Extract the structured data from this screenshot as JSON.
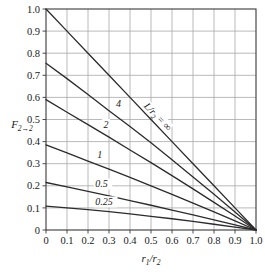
{
  "chart_data": {
    "type": "line",
    "title": "",
    "xlabel": "r1/r2",
    "xlabel_main": "r",
    "xlabel_sub1": "1",
    "xlabel_mid": "/r",
    "xlabel_sub2": "2",
    "ylabel": "F2→2",
    "ylabel_main": "F",
    "ylabel_sub": "2→2",
    "xlim": [
      0,
      1.0
    ],
    "ylim": [
      0,
      1.0
    ],
    "grid": true,
    "legend_position": "inline-curve-labels",
    "xticks": [
      "0",
      "0.1",
      "0.2",
      "0.3",
      "0.4",
      "0.5",
      "0.6",
      "0.7",
      "0.8",
      "0.9",
      "1.0"
    ],
    "xtick_values": [
      0,
      0.1,
      0.2,
      0.3,
      0.4,
      0.5,
      0.6,
      0.7,
      0.8,
      0.9,
      1.0
    ],
    "yticks": [
      "0",
      "0.1",
      "0.2",
      "0.3",
      "0.4",
      "0.5",
      "0.6",
      "0.7",
      "0.8",
      "0.9",
      "1.0"
    ],
    "ytick_values": [
      0,
      0.1,
      0.2,
      0.3,
      0.4,
      0.5,
      0.6,
      0.7,
      0.8,
      0.9,
      1.0
    ],
    "series_param_name": "L/r2",
    "series": [
      {
        "name": "L/r2 = infinity",
        "label": "L/r",
        "label_sub": "2",
        "label_tail": " = ∞",
        "param": "∞",
        "x": [
          0,
          0.1,
          0.2,
          0.3,
          0.4,
          0.5,
          0.6,
          0.7,
          0.8,
          0.9,
          1.0
        ],
        "values": [
          1.0,
          0.9,
          0.8,
          0.7,
          0.6,
          0.5,
          0.4,
          0.3,
          0.2,
          0.1,
          0.0
        ]
      },
      {
        "name": "L/r2 = 4",
        "label": "4",
        "param": "4",
        "x": [
          0,
          0.1,
          0.2,
          0.3,
          0.4,
          0.5,
          0.6,
          0.7,
          0.8,
          0.9,
          1.0
        ],
        "values": [
          0.755,
          0.685,
          0.613,
          0.54,
          0.468,
          0.395,
          0.318,
          0.24,
          0.162,
          0.082,
          0.0
        ]
      },
      {
        "name": "L/r2 = 2",
        "label": "2",
        "param": "2",
        "x": [
          0,
          0.1,
          0.2,
          0.3,
          0.4,
          0.5,
          0.6,
          0.7,
          0.8,
          0.9,
          1.0
        ],
        "values": [
          0.59,
          0.533,
          0.477,
          0.42,
          0.362,
          0.305,
          0.246,
          0.186,
          0.125,
          0.063,
          0.0
        ]
      },
      {
        "name": "L/r2 = 1",
        "label": "1",
        "param": "1",
        "x": [
          0,
          0.1,
          0.2,
          0.3,
          0.4,
          0.5,
          0.6,
          0.7,
          0.8,
          0.9,
          1.0
        ],
        "values": [
          0.385,
          0.349,
          0.312,
          0.275,
          0.238,
          0.2,
          0.161,
          0.122,
          0.082,
          0.041,
          0.0
        ]
      },
      {
        "name": "L/r2 = 0.5",
        "label": "0.5",
        "param": "0.5",
        "x": [
          0,
          0.1,
          0.2,
          0.3,
          0.4,
          0.5,
          0.6,
          0.7,
          0.8,
          0.9,
          1.0
        ],
        "values": [
          0.215,
          0.195,
          0.175,
          0.154,
          0.133,
          0.112,
          0.09,
          0.068,
          0.046,
          0.023,
          0.0
        ]
      },
      {
        "name": "L/r2 = 0.25",
        "label": "0.25",
        "param": "0.25",
        "x": [
          0,
          0.1,
          0.2,
          0.3,
          0.4,
          0.5,
          0.6,
          0.7,
          0.8,
          0.9,
          1.0
        ],
        "values": [
          0.108,
          0.1,
          0.092,
          0.083,
          0.073,
          0.062,
          0.051,
          0.039,
          0.026,
          0.013,
          0.0
        ]
      }
    ],
    "colors": {
      "curve": "#2b2b2b",
      "grid": "#a8a8a8",
      "frame": "#3a3a3a",
      "text": "#1a1a1a",
      "background": "#ffffff"
    }
  }
}
